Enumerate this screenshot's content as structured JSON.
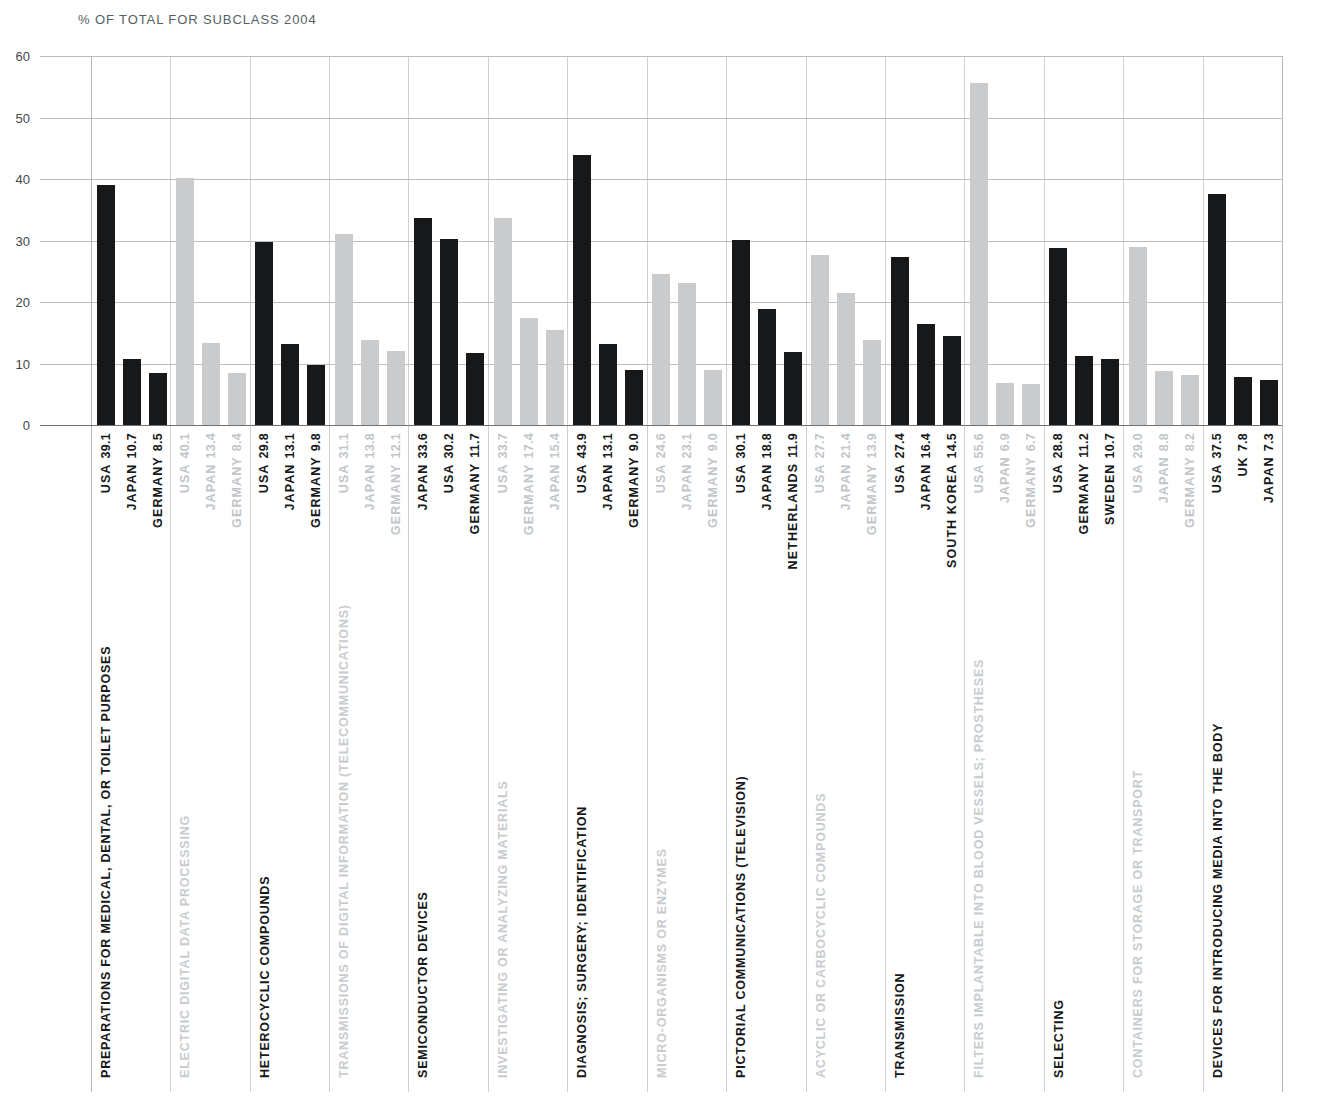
{
  "title": "% OF TOTAL FOR SUBCLASS 2004",
  "colors": {
    "dark": "#17181a",
    "light": "#c9cbcd",
    "grid": "#b9bdc0",
    "axis": "#6d7276",
    "title_text": "#555f66"
  },
  "chart_data": {
    "type": "bar",
    "title": "% OF TOTAL FOR SUBCLASS 2004",
    "xlabel": "",
    "ylabel": "",
    "ylim": [
      0,
      60
    ],
    "yticks": [
      0,
      10,
      20,
      30,
      40,
      50,
      60
    ],
    "grid": true,
    "legend": "none",
    "orientation": "vertical",
    "groups": [
      {
        "category": "PREPARATIONS FOR MEDICAL, DENTAL, OR TOILET PURPOSES",
        "shade": "dark",
        "bars": [
          {
            "country": "USA",
            "value": 39.1
          },
          {
            "country": "JAPAN",
            "value": 10.7
          },
          {
            "country": "GERMANY",
            "value": 8.5
          }
        ]
      },
      {
        "category": "ELECTRIC DIGITAL DATA PROCESSING",
        "shade": "light",
        "bars": [
          {
            "country": "USA",
            "value": 40.1
          },
          {
            "country": "JAPAN",
            "value": 13.4
          },
          {
            "country": "GERMANY",
            "value": 8.4
          }
        ]
      },
      {
        "category": "HETEROCYCLIC COMPOUNDS",
        "shade": "dark",
        "bars": [
          {
            "country": "USA",
            "value": 29.8
          },
          {
            "country": "JAPAN",
            "value": 13.1
          },
          {
            "country": "GERMANY",
            "value": 9.8
          }
        ]
      },
      {
        "category": "TRANSMISSIONS OF DIGITAL INFORMATION (TELECOMMUNICATIONS)",
        "shade": "light",
        "bars": [
          {
            "country": "USA",
            "value": 31.1
          },
          {
            "country": "JAPAN",
            "value": 13.8
          },
          {
            "country": "GERMANY",
            "value": 12.1
          }
        ]
      },
      {
        "category": "SEMICONDUCTOR DEVICES",
        "shade": "dark",
        "bars": [
          {
            "country": "JAPAN",
            "value": 33.6
          },
          {
            "country": "USA",
            "value": 30.2
          },
          {
            "country": "GERMANY",
            "value": 11.7
          }
        ]
      },
      {
        "category": "INVESTIGATING OR ANALYZING MATERIALS",
        "shade": "light",
        "bars": [
          {
            "country": "USA",
            "value": 33.7
          },
          {
            "country": "GERMANY",
            "value": 17.4
          },
          {
            "country": "JAPAN",
            "value": 15.4
          }
        ]
      },
      {
        "category": "DIAGNOSIS; SURGERY; IDENTIFICATION",
        "shade": "dark",
        "bars": [
          {
            "country": "USA",
            "value": 43.9
          },
          {
            "country": "JAPAN",
            "value": 13.1
          },
          {
            "country": "GERMANY",
            "value": 9.0
          }
        ]
      },
      {
        "category": "MICRO-ORGANISMS OR ENZYMES",
        "shade": "light",
        "bars": [
          {
            "country": "USA",
            "value": 24.6
          },
          {
            "country": "JAPAN",
            "value": 23.1
          },
          {
            "country": "GERMANY",
            "value": 9.0
          }
        ]
      },
      {
        "category": "PICTORIAL COMMUNICATIONS (TELEVISION)",
        "shade": "dark",
        "bars": [
          {
            "country": "USA",
            "value": 30.1
          },
          {
            "country": "JAPAN",
            "value": 18.8
          },
          {
            "country": "NETHERLANDS",
            "value": 11.9
          }
        ]
      },
      {
        "category": "ACYCLIC OR CARBOCYCLIC COMPOUNDS",
        "shade": "light",
        "bars": [
          {
            "country": "USA",
            "value": 27.7
          },
          {
            "country": "JAPAN",
            "value": 21.4
          },
          {
            "country": "GERMANY",
            "value": 13.9
          }
        ]
      },
      {
        "category": "TRANSMISSION",
        "shade": "dark",
        "bars": [
          {
            "country": "USA",
            "value": 27.4
          },
          {
            "country": "JAPAN",
            "value": 16.4
          },
          {
            "country": "SOUTH KOREA",
            "value": 14.5
          }
        ]
      },
      {
        "category": "FILTERS IMPLANTABLE INTO BLOOD VESSELS; PROSTHESES",
        "shade": "light",
        "bars": [
          {
            "country": "USA",
            "value": 55.6
          },
          {
            "country": "JAPAN",
            "value": 6.9
          },
          {
            "country": "GERMANY",
            "value": 6.7
          }
        ]
      },
      {
        "category": "SELECTING",
        "shade": "dark",
        "bars": [
          {
            "country": "USA",
            "value": 28.8
          },
          {
            "country": "GERMANY",
            "value": 11.2
          },
          {
            "country": "SWEDEN",
            "value": 10.7
          }
        ]
      },
      {
        "category": "CONTAINERS FOR STORAGE OR TRANSPORT",
        "shade": "light",
        "bars": [
          {
            "country": "USA",
            "value": 29.0
          },
          {
            "country": "JAPAN",
            "value": 8.8
          },
          {
            "country": "GERMANY",
            "value": 8.2
          }
        ]
      },
      {
        "category": "DEVICES FOR INTRODUCING MEDIA INTO THE BODY",
        "shade": "dark",
        "bars": [
          {
            "country": "USA",
            "value": 37.5
          },
          {
            "country": "UK",
            "value": 7.8
          },
          {
            "country": "JAPAN",
            "value": 7.3
          }
        ]
      }
    ]
  }
}
